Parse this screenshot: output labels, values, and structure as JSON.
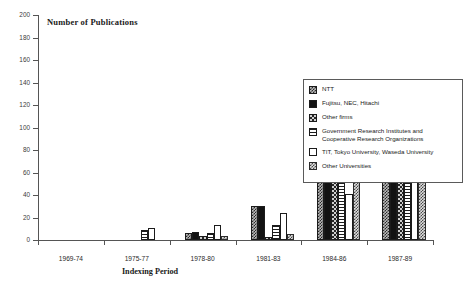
{
  "chart_data": {
    "type": "bar",
    "title": "Number of Publications",
    "xlabel": "Indexing Period",
    "ylabel": "Number of Publications",
    "categories": [
      "1969-74",
      "1975-77",
      "1978-80",
      "1981-83",
      "1984-86",
      "1987-89"
    ],
    "ylim": [
      0,
      200
    ],
    "yticks": [
      0,
      20,
      40,
      60,
      80,
      100,
      120,
      140,
      160,
      180,
      200
    ],
    "grid": false,
    "legend_position": "right",
    "series": [
      {
        "name": "NTT",
        "values": [
          0,
          0,
          6,
          30,
          83,
          97
        ]
      },
      {
        "name": "Fujitsu, NEC, Hitachi",
        "values": [
          0,
          0,
          7,
          30,
          69,
          137
        ]
      },
      {
        "name": "Other firms",
        "values": [
          0,
          0,
          4,
          3,
          67,
          124
        ]
      },
      {
        "name": "Government Research Institutes and Cooperative Research Organizations",
        "values": [
          0,
          9,
          6,
          13,
          73,
          81
        ]
      },
      {
        "name": "TIT, Tokyo University, Waseda University",
        "values": [
          0,
          11,
          13,
          24,
          41,
          67
        ]
      },
      {
        "name": "Other Universities",
        "values": [
          0,
          0,
          4,
          5,
          56,
          111
        ]
      }
    ]
  },
  "legend": {
    "items": [
      {
        "label": "NTT",
        "pattern": "p-ntt",
        "icon": "legend-swatch-ntt"
      },
      {
        "label": "Fujitsu, NEC, Hitachi",
        "pattern": "p-fujitsu",
        "icon": "legend-swatch-fujitsu"
      },
      {
        "label": "Other firms",
        "pattern": "p-otherfirms",
        "icon": "legend-swatch-other-firms"
      },
      {
        "label": "Government Research Institutes and Cooperative Research Organizations",
        "pattern": "p-gov",
        "icon": "legend-swatch-government"
      },
      {
        "label": "TIT, Tokyo University, Waseda University",
        "pattern": "p-tit",
        "icon": "legend-swatch-universities"
      },
      {
        "label": "Other Universities",
        "pattern": "p-otheruni",
        "icon": "legend-swatch-other-universities"
      }
    ]
  },
  "colors": {
    "axis": "#555555",
    "bar_outline": "#1b1b1b",
    "text": "#222222",
    "background": "#ffffff"
  }
}
